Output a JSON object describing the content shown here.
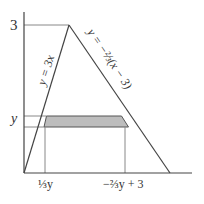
{
  "diagram": {
    "y_axis_tick_labels": {
      "top": "3",
      "band": "y"
    },
    "x_axis_tick_labels": {
      "left": "⅓y",
      "right": "−⅔y + 3"
    },
    "curves": [
      {
        "name": "left-line",
        "label": "y = 3x"
      },
      {
        "name": "right-line",
        "label": "y = −⅔(x − 3)"
      }
    ],
    "shaded_region": "horizontal strip between y and y+Δy, bounded by both lines",
    "colors": {
      "line": "#444444",
      "guide": "#888888",
      "shade": "#bdbdbd"
    }
  }
}
